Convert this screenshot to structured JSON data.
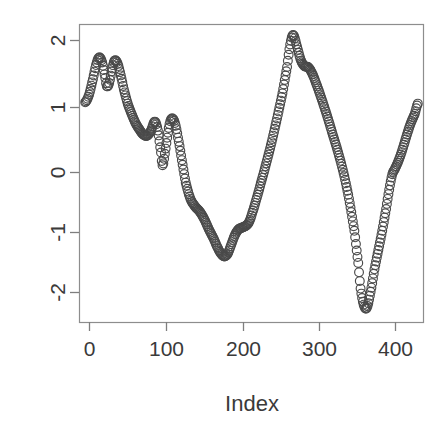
{
  "chart_data": {
    "type": "scatter",
    "title": "",
    "subtitle": "",
    "xlabel": "Index",
    "ylabel": "",
    "grid": false,
    "legend": null,
    "legend_position": "none",
    "point_style": "open-circle",
    "point_color": "#4a4a4a",
    "xlim": [
      -8,
      438
    ],
    "ylim": [
      -2.42,
      2.22
    ],
    "xticks": [
      0,
      100,
      200,
      300,
      400
    ],
    "xtick_labels": [
      "0",
      "100",
      "200",
      "300",
      "400"
    ],
    "yticks": [
      -2,
      -1,
      0,
      1,
      2
    ],
    "ytick_labels": [
      "-2",
      "-1",
      "0",
      "1",
      "2"
    ],
    "n_points": 431,
    "annotations": [],
    "series": [
      {
        "name": "series-1",
        "anchors_x": [
          0,
          5,
          10,
          14,
          18,
          22,
          26,
          28,
          31,
          34,
          38,
          42,
          46,
          50,
          55,
          60,
          65,
          70,
          75,
          80,
          85,
          90,
          94,
          98,
          100,
          103,
          106,
          109,
          112,
          116,
          120,
          125,
          130,
          136,
          142,
          148,
          154,
          160,
          166,
          172,
          176,
          180,
          184,
          188,
          193,
          198,
          203,
          208,
          212,
          216,
          221,
          227,
          234,
          241,
          248,
          255,
          261,
          265,
          269,
          274,
          279,
          284,
          288,
          293,
          299,
          306,
          313,
          320,
          327,
          334,
          341,
          348,
          353,
          356,
          360,
          364,
          369,
          374,
          379,
          384,
          389,
          393,
          397,
          401,
          406,
          411,
          416,
          421,
          426,
          430
        ],
        "anchors_y": [
          1.0,
          1.12,
          1.36,
          1.58,
          1.7,
          1.62,
          1.38,
          1.25,
          1.3,
          1.48,
          1.65,
          1.6,
          1.42,
          1.2,
          0.98,
          0.82,
          0.68,
          0.58,
          0.5,
          0.48,
          0.56,
          0.7,
          0.56,
          0.22,
          0.02,
          0.2,
          0.45,
          0.66,
          0.75,
          0.68,
          0.45,
          0.1,
          -0.25,
          -0.5,
          -0.62,
          -0.7,
          -0.82,
          -0.98,
          -1.12,
          -1.28,
          -1.36,
          -1.4,
          -1.36,
          -1.24,
          -1.08,
          -0.98,
          -0.95,
          -0.92,
          -0.86,
          -0.72,
          -0.52,
          -0.26,
          0.05,
          0.38,
          0.75,
          1.14,
          1.55,
          1.9,
          2.05,
          1.86,
          1.65,
          1.56,
          1.55,
          1.46,
          1.28,
          1.04,
          0.78,
          0.5,
          0.22,
          -0.1,
          -0.5,
          -1.0,
          -1.5,
          -1.9,
          -2.15,
          -2.2,
          -1.95,
          -1.6,
          -1.3,
          -1.0,
          -0.66,
          -0.36,
          -0.12,
          -0.02,
          0.12,
          0.3,
          0.5,
          0.68,
          0.82,
          0.98
        ],
        "key_features": [
          {
            "index": 0,
            "value": 1.0,
            "label": "start"
          },
          {
            "index": 18,
            "value": 1.7,
            "label": "local-peak"
          },
          {
            "index": 28,
            "value": 1.25,
            "label": "local-dip"
          },
          {
            "index": 38,
            "value": 1.65,
            "label": "local-peak"
          },
          {
            "index": 90,
            "value": 0.7,
            "label": "local-peak"
          },
          {
            "index": 100,
            "value": 0.02,
            "label": "local-dip"
          },
          {
            "index": 112,
            "value": 0.75,
            "label": "local-peak"
          },
          {
            "index": 180,
            "value": -1.4,
            "label": "local-trough"
          },
          {
            "index": 205,
            "value": -0.94,
            "label": "shoulder"
          },
          {
            "index": 265,
            "value": 2.05,
            "label": "global-maximum"
          },
          {
            "index": 288,
            "value": 1.55,
            "label": "shoulder"
          },
          {
            "index": 356,
            "value": -2.2,
            "label": "global-minimum"
          },
          {
            "index": 398,
            "value": -0.05,
            "label": "shoulder"
          },
          {
            "index": 430,
            "value": 0.98,
            "label": "end"
          }
        ]
      }
    ]
  },
  "geometry": {
    "plot_left": 79,
    "plot_right": 424,
    "plot_top": 24,
    "plot_bottom": 322,
    "x_tick_pixels": [
      89,
      166,
      243,
      319,
      395
    ],
    "y_tick_pixels": [
      292,
      232,
      172,
      107,
      40
    ],
    "xlabel_x": 252,
    "xlabel_y": 411
  }
}
